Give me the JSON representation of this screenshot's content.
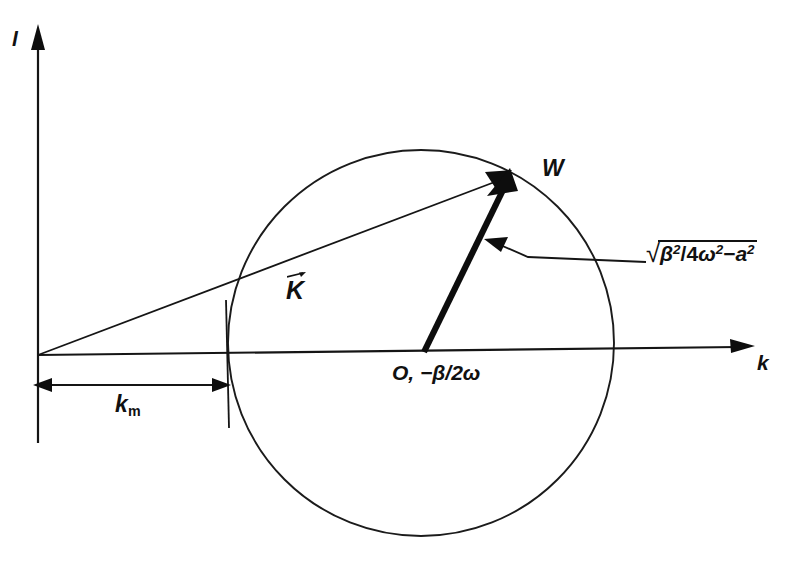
{
  "figure": {
    "background_color": "#ffffff",
    "ink_color": "#111111"
  },
  "axes": {
    "y_label": "l",
    "x_label": "k",
    "origin_label": "",
    "y_axis_name": "vertical-imaginary-axis",
    "x_axis_name": "horizontal-k-axis"
  },
  "labels": {
    "k_vector": "K",
    "k_vector_accent": "vector-arrow",
    "w_point": "W",
    "center_point": "O,  −β/2ω",
    "km_base": "k",
    "km_subscript": "m"
  },
  "formula": {
    "radical_sign": "√",
    "numerator_base": "β",
    "numerator_exp": "2",
    "divider": "/",
    "denominator_coeff": "4",
    "denominator_base": "ω",
    "denominator_exp": "2",
    "minus": "−",
    "subtrahend_base": "a",
    "subtrahend_exp": "2",
    "plain_text": "√(β² / 4ω² − a²)"
  },
  "geometry": {
    "origin": [
      38,
      355
    ],
    "circle_center": [
      421,
      343
    ],
    "circle_radius": 193,
    "w_point": [
      508,
      172
    ],
    "km_tick_x": 226,
    "dimension_line_y": 385,
    "pointer_from": [
      646,
      262
    ],
    "pointer_to": [
      490,
      244
    ]
  }
}
